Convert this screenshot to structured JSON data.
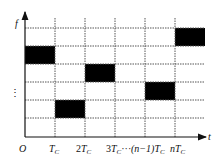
{
  "diagram": {
    "type": "time-frequency hopping grid",
    "y_axis_label": "f",
    "x_axis_label": "t",
    "origin_label": "O",
    "vertical_ellipsis": "⋮",
    "x_ticks": [
      {
        "main": "T",
        "sub": "C",
        "prefix": ""
      },
      {
        "main": "T",
        "sub": "C",
        "prefix": "2"
      },
      {
        "main": "T",
        "sub": "C",
        "prefix": "3",
        "suffix": "···"
      },
      {
        "main": "T",
        "sub": "C",
        "prefix": "(n−1)"
      },
      {
        "main": "T",
        "sub": "C",
        "prefix": "n"
      }
    ],
    "grid": {
      "columns": 6,
      "rows": 6
    },
    "filled_cells": [
      {
        "col": 0,
        "row": 1
      },
      {
        "col": 1,
        "row": 5
      },
      {
        "col": 2,
        "row": 2
      },
      {
        "col": 4,
        "row": 3
      },
      {
        "col": 5,
        "row": 0
      }
    ],
    "colors": {
      "fill": "#000000",
      "grid": "#555555",
      "axis": "#111111"
    }
  }
}
